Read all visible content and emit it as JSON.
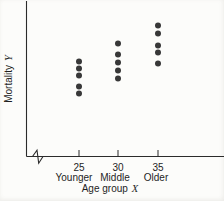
{
  "figure": {
    "ylabel_text": "Mortality",
    "ylabel_var": "Y",
    "xlabel_text": "Age group",
    "xlabel_var": "X"
  },
  "chart_data": {
    "type": "scatter",
    "title": "",
    "xlabel": "Age group X",
    "ylabel": "Mortality Y",
    "x_tick_labels": [
      "25",
      "30",
      "35"
    ],
    "group_labels": [
      "Younger",
      "Middle",
      "Older"
    ],
    "x_axis_break": true,
    "y_axis_tick_labels": "none",
    "y_units": "arbitrary (y scale unlabeled in figure)",
    "point_color": "#383838",
    "axis_color": "#2b2b2b",
    "xlim": [
      20,
      40
    ],
    "ylim": [
      0,
      155
    ],
    "grid": false,
    "legend": "none",
    "series": [
      {
        "name": "Younger",
        "x": 25,
        "y": [
          63,
          70,
          81,
          88,
          95
        ]
      },
      {
        "name": "Middle",
        "x": 30,
        "y": [
          78,
          86,
          94,
          102,
          113
        ]
      },
      {
        "name": "Older",
        "x": 35,
        "y": [
          93,
          104,
          111,
          123,
          131
        ]
      }
    ]
  }
}
